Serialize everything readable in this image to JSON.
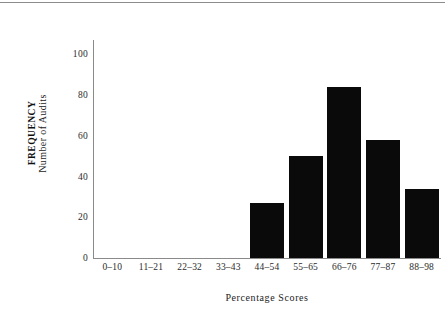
{
  "figure": {
    "background_color": "#ffffff",
    "bar_color": "#0a0a0a",
    "axis_color": "#8a8a8a",
    "top_rule": "horizontal-rule"
  },
  "axis_titles": {
    "x": "Percentage Scores",
    "y_inner": "Number of Audits",
    "y_outer": "FREQUENCY"
  },
  "chart_data": {
    "type": "bar",
    "title": "",
    "subtitle": "",
    "xlabel": "Percentage Scores",
    "ylabel": "Number of Audits",
    "ylabel_outer": "FREQUENCY",
    "categories": [
      "0–10",
      "11–21",
      "22–32",
      "33–43",
      "44–54",
      "55–65",
      "66–76",
      "77–87",
      "88–98"
    ],
    "values": [
      0,
      0,
      0,
      0,
      27,
      50,
      84,
      58,
      34
    ],
    "ylim": [
      0,
      107
    ],
    "yticks": [
      0,
      20,
      40,
      60,
      80,
      100
    ],
    "ytick_labels": [
      "0",
      "20",
      "40",
      "60",
      "80",
      "100"
    ],
    "grid": false,
    "legend": "none",
    "bar_color": "#0a0a0a",
    "orientation": "vertical"
  }
}
